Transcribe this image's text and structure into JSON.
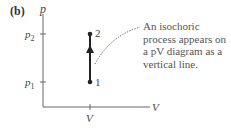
{
  "panel_label": "(b)",
  "axes": {
    "y_label": "p",
    "x_label": "V",
    "y_ticks": [
      "p2",
      "p1"
    ],
    "x_ticks": [
      "V"
    ]
  },
  "points": [
    {
      "label": "1",
      "V": "V",
      "p": "p1"
    },
    {
      "label": "2",
      "V": "V",
      "p": "p2"
    }
  ],
  "process": {
    "from": "1",
    "to": "2",
    "type": "isochoric",
    "direction": "up"
  },
  "annotation": "An isochoric process appears on a pV diagram as a vertical line."
}
